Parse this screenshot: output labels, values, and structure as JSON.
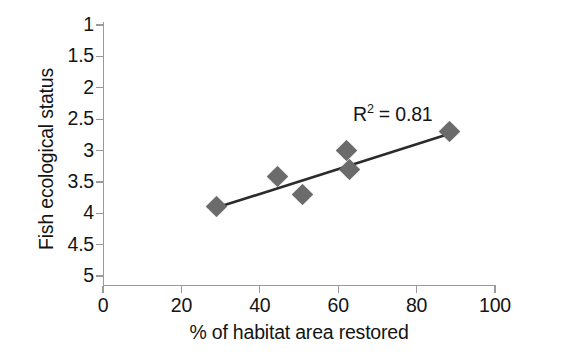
{
  "chart_data": {
    "type": "scatter",
    "title": "",
    "xlabel": "% of habitat area restored",
    "ylabel": "Fish ecological status",
    "xlim": [
      0,
      100
    ],
    "ylim": [
      1,
      5
    ],
    "y_axis_inverted": true,
    "grid": false,
    "legend": null,
    "x_ticks": [
      "0",
      "20",
      "40",
      "60",
      "80",
      "100"
    ],
    "x_tick_values": [
      0,
      20,
      40,
      60,
      80,
      100
    ],
    "y_ticks": [
      "1",
      "1.5",
      "2",
      "2.5",
      "3",
      "3.5",
      "4",
      "4.5",
      "5"
    ],
    "y_tick_values": [
      1,
      1.5,
      2,
      2.5,
      3,
      3.5,
      4,
      4.5,
      5
    ],
    "points": [
      {
        "x": 29.0,
        "y": 3.9
      },
      {
        "x": 44.5,
        "y": 3.42
      },
      {
        "x": 51.0,
        "y": 3.7
      },
      {
        "x": 62.0,
        "y": 3.0
      },
      {
        "x": 63.0,
        "y": 3.3
      },
      {
        "x": 88.5,
        "y": 2.7
      }
    ],
    "marker_style": "diamond",
    "marker_color": "#6b6b6b",
    "trendline": {
      "type": "linear",
      "x_start": 28.0,
      "y_start": 3.93,
      "x_end": 89.0,
      "y_end": 2.72,
      "color": "#2b2b2b"
    },
    "annotations": [
      {
        "text_prefix": "R",
        "superscript": "2",
        "text_suffix": " = 0.81",
        "full_text": "R2 = 0.81"
      }
    ]
  },
  "axes": {
    "x_title": "% of habitat area restored",
    "y_title": "Fish ecological status",
    "axis_color": "#9a9a9a"
  },
  "annotation": {
    "r_label": "R",
    "r_exponent": "2",
    "r_value": " = 0.81"
  }
}
